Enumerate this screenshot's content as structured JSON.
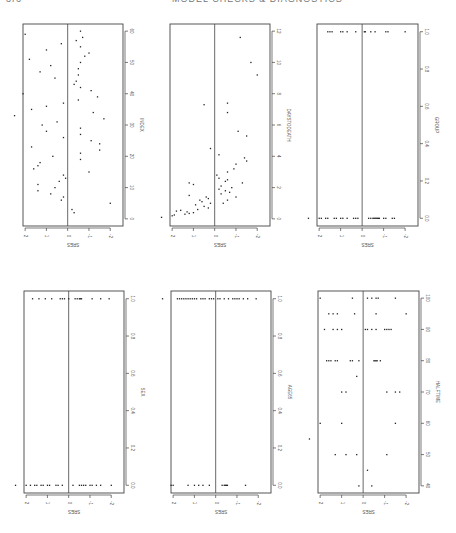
{
  "page_header": {
    "page_number": "376",
    "running_title": "MODEL CHECKS & DIAGNOSTICS"
  },
  "chart_data": [
    {
      "id": "p1",
      "type": "scatter",
      "orientation": "rotated-90",
      "xlabel": "INDEX",
      "ylabel": "SRES",
      "x_ticks": [
        0,
        10,
        20,
        30,
        40,
        50,
        60
      ],
      "x_range": [
        -1,
        61
      ],
      "y_ticks": [
        2,
        1,
        0,
        -1,
        -2
      ],
      "y_range": [
        -2.6,
        2.1
      ],
      "points": [
        [
          2,
          -0.3
        ],
        [
          3,
          -0.2
        ],
        [
          5,
          -2
        ],
        [
          6,
          0.3
        ],
        [
          7,
          0.2
        ],
        [
          8,
          0.8
        ],
        [
          9,
          1.4
        ],
        [
          10,
          0.6
        ],
        [
          11,
          1.4
        ],
        [
          12,
          0.4
        ],
        [
          13,
          0.1
        ],
        [
          14,
          0.2
        ],
        [
          15,
          -1
        ],
        [
          16,
          1.6
        ],
        [
          17,
          1.4
        ],
        [
          18,
          1.3
        ],
        [
          19,
          -0.6
        ],
        [
          20,
          0.7
        ],
        [
          21,
          -0.6
        ],
        [
          22,
          -1.5
        ],
        [
          23,
          1.7
        ],
        [
          24,
          -1.5
        ],
        [
          25,
          -1.1
        ],
        [
          26,
          0.2
        ],
        [
          27,
          -0.6
        ],
        [
          28,
          1.0
        ],
        [
          29,
          -0.6
        ],
        [
          30,
          1.2
        ],
        [
          31,
          0.5
        ],
        [
          32,
          -1.7
        ],
        [
          33,
          2.5
        ],
        [
          34,
          -1.2
        ],
        [
          35,
          1.7
        ],
        [
          36,
          1.0
        ],
        [
          37,
          0.2
        ],
        [
          38,
          -0.5
        ],
        [
          39,
          -1.4
        ],
        [
          40,
          2.1
        ],
        [
          41,
          -1.1
        ],
        [
          42,
          -0.6
        ],
        [
          43,
          -0.3
        ],
        [
          44,
          -0.4
        ],
        [
          45,
          0.6
        ],
        [
          46,
          -0.5
        ],
        [
          47,
          1.3
        ],
        [
          48,
          -0.5
        ],
        [
          49,
          0.8
        ],
        [
          50,
          -0.6
        ],
        [
          51,
          1.8
        ],
        [
          52,
          -0.8
        ],
        [
          53,
          -1.0
        ],
        [
          54,
          1.0
        ],
        [
          55,
          -0.6
        ],
        [
          56,
          0.3
        ],
        [
          57,
          -0.4
        ],
        [
          58,
          -0.7
        ],
        [
          59,
          2.0
        ],
        [
          60,
          -0.6
        ]
      ]
    },
    {
      "id": "p2",
      "type": "scatter",
      "orientation": "rotated-90",
      "xlabel": "DAYSTODEATH",
      "ylabel": "SRES",
      "x_ticks": [
        0,
        2,
        4,
        6,
        8,
        10,
        12
      ],
      "x_range": [
        -0.2,
        12.2
      ],
      "y_ticks": [
        2,
        1,
        0,
        -1,
        -2
      ],
      "y_range": [
        -2.6,
        2.1
      ],
      "points": [
        [
          0.1,
          2.5
        ],
        [
          0.2,
          2.0
        ],
        [
          0.25,
          1.9
        ],
        [
          0.3,
          1.4
        ],
        [
          0.35,
          1.2
        ],
        [
          0.4,
          1.0
        ],
        [
          0.45,
          1.3
        ],
        [
          0.5,
          1.8
        ],
        [
          0.55,
          1.6
        ],
        [
          0.6,
          0.8
        ],
        [
          0.7,
          0.3
        ],
        [
          0.8,
          0.5
        ],
        [
          0.9,
          0.9
        ],
        [
          1.0,
          0.2
        ],
        [
          1.1,
          0.6
        ],
        [
          1.2,
          0.7
        ],
        [
          1.3,
          0.3
        ],
        [
          1.4,
          0.4
        ],
        [
          1.5,
          1.2
        ],
        [
          2.2,
          1.0
        ],
        [
          2.3,
          1.2
        ],
        [
          1.0,
          -0.4
        ],
        [
          1.2,
          -0.6
        ],
        [
          1.4,
          -1.0
        ],
        [
          1.6,
          -0.3
        ],
        [
          1.7,
          -0.7
        ],
        [
          1.8,
          -0.5
        ],
        [
          1.9,
          -0.2
        ],
        [
          2.0,
          -0.8
        ],
        [
          2.1,
          -0.3
        ],
        [
          2.3,
          -1.3
        ],
        [
          2.4,
          -0.5
        ],
        [
          2.5,
          -0.6
        ],
        [
          2.6,
          -0.2
        ],
        [
          2.8,
          -0.1
        ],
        [
          3.0,
          -0.6
        ],
        [
          3.2,
          -0.9
        ],
        [
          3.5,
          -1.0
        ],
        [
          3.7,
          -1.5
        ],
        [
          3.9,
          -1.4
        ],
        [
          4.1,
          -0.2
        ],
        [
          4.5,
          0.2
        ],
        [
          5.3,
          -1.5
        ],
        [
          5.6,
          -1.1
        ],
        [
          6.8,
          -0.6
        ],
        [
          7.4,
          -0.6
        ],
        [
          7.3,
          0.5
        ],
        [
          9.2,
          -2.0
        ],
        [
          10.0,
          -1.7
        ],
        [
          11.6,
          -1.2
        ]
      ]
    },
    {
      "id": "p3",
      "type": "scatter",
      "orientation": "rotated-90",
      "xlabel": "GROUP",
      "ylabel": "SRES",
      "x_ticks": [
        "0.0",
        "0.2",
        "0.4",
        "0.6",
        "0.8",
        "1.0"
      ],
      "x_range": [
        -0.02,
        1.02
      ],
      "y_ticks": [
        2,
        1,
        0,
        -1,
        -2
      ],
      "y_range": [
        -2.6,
        2.1
      ],
      "points": [
        [
          0,
          2.5
        ],
        [
          0,
          2.0
        ],
        [
          0,
          1.9
        ],
        [
          0,
          1.7
        ],
        [
          0,
          1.6
        ],
        [
          0,
          1.3
        ],
        [
          0,
          1.2
        ],
        [
          0,
          1.0
        ],
        [
          0,
          0.9
        ],
        [
          0,
          0.7
        ],
        [
          0,
          0.4
        ],
        [
          0,
          0.3
        ],
        [
          0,
          0.2
        ],
        [
          0,
          -0.3
        ],
        [
          0,
          -0.4
        ],
        [
          0,
          -0.5
        ],
        [
          0,
          -0.55
        ],
        [
          0,
          -0.6
        ],
        [
          0,
          -0.65
        ],
        [
          0,
          -0.7
        ],
        [
          0,
          -0.75
        ],
        [
          0,
          -0.8
        ],
        [
          0,
          -1.0
        ],
        [
          0,
          -1.1
        ],
        [
          0,
          -1.4
        ],
        [
          0,
          -1.5
        ],
        [
          1,
          1.6
        ],
        [
          1,
          1.5
        ],
        [
          1,
          1.4
        ],
        [
          1,
          1.0
        ],
        [
          1,
          0.9
        ],
        [
          1,
          0.7
        ],
        [
          1,
          0.3
        ],
        [
          1,
          -0.1
        ],
        [
          1,
          -0.15
        ],
        [
          1,
          -0.4
        ],
        [
          1,
          -0.6
        ],
        [
          1,
          -1.1
        ],
        [
          1,
          -1.2
        ],
        [
          1,
          -2.0
        ]
      ]
    },
    {
      "id": "p4",
      "type": "scatter",
      "orientation": "rotated-90",
      "xlabel": "SEX",
      "ylabel": "SRES",
      "x_ticks": [
        "0.0",
        "0.2",
        "0.4",
        "0.6",
        "0.8",
        "1.0"
      ],
      "x_range": [
        -0.02,
        1.02
      ],
      "y_ticks": [
        2,
        1,
        0,
        -1,
        -2
      ],
      "y_range": [
        -2.6,
        2.1
      ],
      "points": [
        [
          0,
          2.5
        ],
        [
          0,
          2.0
        ],
        [
          0,
          1.8
        ],
        [
          0,
          1.6
        ],
        [
          0,
          1.5
        ],
        [
          0,
          1.3
        ],
        [
          0,
          1.2
        ],
        [
          0,
          1.0
        ],
        [
          0,
          0.9
        ],
        [
          0,
          0.6
        ],
        [
          0,
          0.5
        ],
        [
          0,
          0.3
        ],
        [
          0,
          -0.2
        ],
        [
          0,
          -0.5
        ],
        [
          0,
          -0.6
        ],
        [
          0,
          -0.7
        ],
        [
          0,
          -0.8
        ],
        [
          0,
          -1.0
        ],
        [
          0,
          -1.1
        ],
        [
          0,
          -1.3
        ],
        [
          0,
          -1.5
        ],
        [
          0,
          -2.0
        ],
        [
          1,
          1.7
        ],
        [
          1,
          1.4
        ],
        [
          1,
          1.1
        ],
        [
          1,
          0.8
        ],
        [
          1,
          0.4
        ],
        [
          1,
          0.3
        ],
        [
          1,
          0.2
        ],
        [
          1,
          0.0
        ],
        [
          1,
          -0.3
        ],
        [
          1,
          -0.4
        ],
        [
          1,
          -0.5
        ],
        [
          1,
          -0.55
        ],
        [
          1,
          -0.6
        ],
        [
          1,
          -1.1
        ],
        [
          1,
          -1.5
        ],
        [
          1,
          -1.9
        ]
      ]
    },
    {
      "id": "p5",
      "type": "scatter",
      "orientation": "rotated-90",
      "xlabel": "AGE65",
      "ylabel": "SRES",
      "x_ticks": [
        "0.0",
        "0.2",
        "0.4",
        "0.6",
        "0.8",
        "1.0"
      ],
      "x_range": [
        -0.02,
        1.02
      ],
      "y_ticks": [
        2,
        1,
        0,
        -1,
        -2
      ],
      "y_range": [
        -2.6,
        2.1
      ],
      "points": [
        [
          0,
          2.1
        ],
        [
          0,
          2.0
        ],
        [
          0,
          1.3
        ],
        [
          0,
          1.0
        ],
        [
          0,
          0.8
        ],
        [
          0,
          0.6
        ],
        [
          0,
          0.3
        ],
        [
          0,
          -0.3
        ],
        [
          0,
          -0.4
        ],
        [
          0,
          -0.45
        ],
        [
          0,
          -0.5
        ],
        [
          0,
          -0.55
        ],
        [
          0,
          -1.4
        ],
        [
          1,
          2.5
        ],
        [
          1,
          1.8
        ],
        [
          1,
          1.7
        ],
        [
          1,
          1.6
        ],
        [
          1,
          1.5
        ],
        [
          1,
          1.4
        ],
        [
          1,
          1.3
        ],
        [
          1,
          1.2
        ],
        [
          1,
          1.1
        ],
        [
          1,
          1.0
        ],
        [
          1,
          0.9
        ],
        [
          1,
          0.7
        ],
        [
          1,
          0.6
        ],
        [
          1,
          0.5
        ],
        [
          1,
          0.3
        ],
        [
          1,
          0.2
        ],
        [
          1,
          0.1
        ],
        [
          1,
          -0.1
        ],
        [
          1,
          -0.2
        ],
        [
          1,
          -0.4
        ],
        [
          1,
          -0.6
        ],
        [
          1,
          -0.8
        ],
        [
          1,
          -0.9
        ],
        [
          1,
          -1.0
        ],
        [
          1,
          -1.1
        ],
        [
          1,
          -1.3
        ],
        [
          1,
          -1.5
        ],
        [
          1,
          -1.9
        ]
      ]
    },
    {
      "id": "p6",
      "type": "scatter",
      "orientation": "rotated-90",
      "xlabel": "HALFTIME",
      "ylabel": "SRES",
      "x_ticks": [
        40,
        50,
        60,
        70,
        80,
        90,
        100
      ],
      "x_range": [
        39,
        101
      ],
      "y_ticks": [
        2,
        1,
        0,
        -1,
        -2
      ],
      "y_range": [
        -2.6,
        2.1
      ],
      "points": [
        [
          40,
          0.2
        ],
        [
          40,
          -0.4
        ],
        [
          45,
          -0.2
        ],
        [
          50,
          1.3
        ],
        [
          50,
          0.8
        ],
        [
          50,
          0.3
        ],
        [
          50,
          -1.1
        ],
        [
          55,
          2.5
        ],
        [
          60,
          2.0
        ],
        [
          60,
          1.0
        ],
        [
          60,
          -1.5
        ],
        [
          70,
          1.0
        ],
        [
          70,
          0.8
        ],
        [
          70,
          -1.1
        ],
        [
          70,
          -1.5
        ],
        [
          70,
          -1.7
        ],
        [
          75,
          0.3
        ],
        [
          80,
          1.7
        ],
        [
          80,
          1.6
        ],
        [
          80,
          1.5
        ],
        [
          80,
          1.3
        ],
        [
          80,
          1.2
        ],
        [
          80,
          0.6
        ],
        [
          80,
          0.5
        ],
        [
          80,
          0.2
        ],
        [
          80,
          -0.5
        ],
        [
          80,
          -0.55
        ],
        [
          80,
          -0.6
        ],
        [
          80,
          -0.65
        ],
        [
          80,
          -0.8
        ],
        [
          90,
          1.8
        ],
        [
          90,
          1.4
        ],
        [
          90,
          1.2
        ],
        [
          90,
          1.0
        ],
        [
          90,
          -0.1
        ],
        [
          90,
          -0.2
        ],
        [
          90,
          -0.4
        ],
        [
          90,
          -0.6
        ],
        [
          90,
          -1.0
        ],
        [
          90,
          -1.1
        ],
        [
          90,
          -1.2
        ],
        [
          90,
          -1.3
        ],
        [
          95,
          1.6
        ],
        [
          95,
          1.4
        ],
        [
          95,
          1.2
        ],
        [
          95,
          0.4
        ],
        [
          95,
          -0.6
        ],
        [
          95,
          -2.0
        ],
        [
          100,
          2.0
        ],
        [
          100,
          0.5
        ],
        [
          100,
          -0.2
        ],
        [
          100,
          -0.4
        ],
        [
          100,
          -0.6
        ],
        [
          100,
          -0.7
        ],
        [
          100,
          -1.5
        ]
      ]
    }
  ]
}
